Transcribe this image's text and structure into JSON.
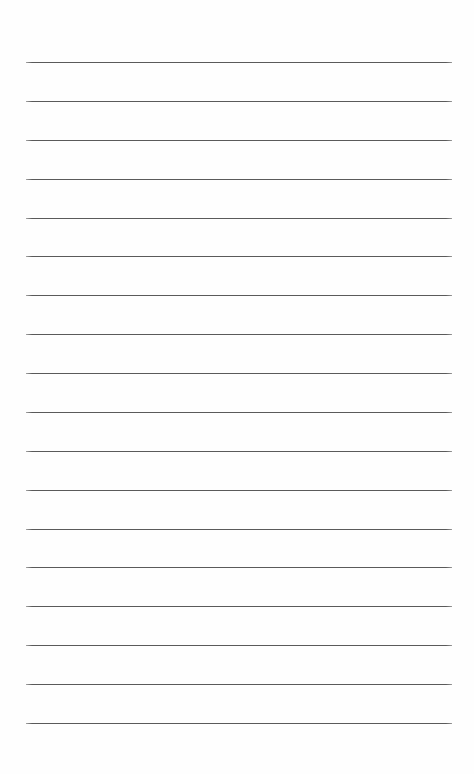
{
  "document": {
    "kind": "lined-paper-sheet",
    "title": "Blank Lined Paper",
    "page_width": 474,
    "page_height": 774,
    "background_color": "#fefefe",
    "content_text": "",
    "has_text_content": false,
    "has_margin_rule": false,
    "has_holes": false,
    "has_header": false,
    "has_page_number": false
  },
  "rules": {
    "count": 18,
    "color": "#5a5a5a",
    "thickness_px": 1.5,
    "left_px": 26,
    "right_px": 452,
    "line_length_px": 426,
    "first_line_y_px": 62,
    "spacing_px": 38.9,
    "orientation": "horizontal",
    "positions_y_px": [
      62,
      101,
      140,
      179,
      218,
      256,
      295,
      334,
      373,
      412,
      451,
      490,
      529,
      567,
      606,
      645,
      684,
      723
    ]
  }
}
